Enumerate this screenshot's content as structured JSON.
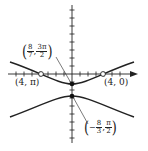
{
  "diagram": {
    "type": "polar-conic-graph",
    "colors": {
      "curve": "#222222",
      "axis": "#222222",
      "background": "#ffffff"
    },
    "axes": {
      "origin_px": [
        72,
        74
      ],
      "tick_spacing_px": 8,
      "x_ticks_left": 7,
      "x_ticks_right": 6,
      "y_ticks_up": 8,
      "y_ticks_down": 8
    },
    "points": [
      {
        "id": "vertex-upper",
        "label_num_a": "8",
        "label_den_a": "7",
        "sep": ",",
        "label_num_b": "3π",
        "label_den_b": "2",
        "sign_a": "",
        "style": "filled",
        "px": [
          72,
          84
        ]
      },
      {
        "id": "vertex-lower",
        "label_num_a": "8",
        "label_den_a": "3",
        "sep": ",",
        "label_num_b": "π",
        "label_den_b": "2",
        "sign_a": "−",
        "style": "filled",
        "px": [
          72,
          96
        ]
      },
      {
        "id": "intercept-left",
        "label": "(4, π)",
        "style": "open",
        "px": [
          41,
          74
        ]
      },
      {
        "id": "intercept-right",
        "label": "(4, 0)",
        "style": "open",
        "px": [
          103,
          74
        ]
      }
    ]
  }
}
